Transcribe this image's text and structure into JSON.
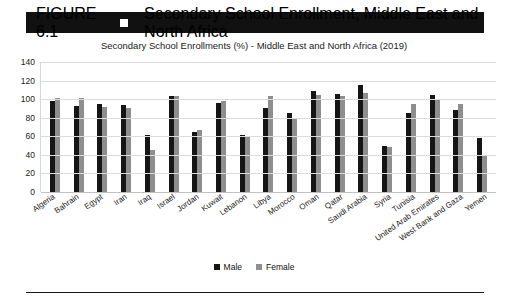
{
  "figure": {
    "number": "FIGURE 6.1",
    "marker_icon": "square-marker-icon",
    "title": "Secondary School Enrollment, Middle East and North Africa"
  },
  "legend": {
    "male_label": "Male",
    "female_label": "Female",
    "position": "bottom-center"
  },
  "colors": {
    "male": "#151515",
    "female": "#8e8e8e",
    "header_bar": "#111111",
    "header_text": "#ffffff",
    "grid": "#dcdcdc"
  },
  "chart_data": {
    "type": "bar",
    "title": "Secondary School Enrollments (%) - Middle East and North Africa (2019)",
    "xlabel": "",
    "ylabel": "",
    "ylim": [
      0,
      140
    ],
    "yticks": [
      0,
      20,
      40,
      60,
      80,
      100,
      120,
      140
    ],
    "grid": true,
    "legend_position": "bottom-center",
    "categories": [
      "Algeria",
      "Bahrain",
      "Egypt",
      "Iran",
      "Iraq",
      "Israel",
      "Jordan",
      "Kuwait",
      "Lebanon",
      "Libya",
      "Morocco",
      "Oman",
      "Qatar",
      "Saudi Arabia",
      "Syria",
      "Tunisia",
      "United Arab Emirates",
      "West Bank and Gaza",
      "Yemen"
    ],
    "series": [
      {
        "name": "Male",
        "values": [
          98,
          93,
          95,
          94,
          61,
          103,
          65,
          96,
          61,
          90,
          85,
          109,
          106,
          115,
          50,
          85,
          104,
          88,
          58
        ]
      },
      {
        "name": "Female",
        "values": [
          101,
          101,
          92,
          90,
          45,
          103,
          67,
          98,
          60,
          103,
          80,
          105,
          103,
          107,
          49,
          95,
          100,
          95,
          40
        ]
      }
    ]
  }
}
